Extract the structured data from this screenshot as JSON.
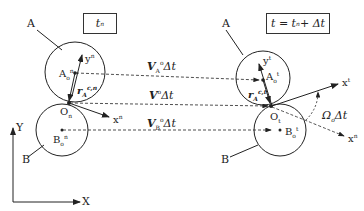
{
  "left_frame": {
    "time_box": "t",
    "time_box_sub": "n",
    "body_A_label": "A",
    "body_B_label": "B",
    "point_A": "A",
    "point_A_sub": "o",
    "point_A_sup": "n",
    "point_B": "B",
    "point_B_sub": "o",
    "point_B_sup": "n",
    "contact_point": "O",
    "contact_point_sub": "n",
    "axis_x": "x",
    "axis_x_sup": "n",
    "axis_y": "y",
    "axis_y_sup": "n",
    "r_vector": "r",
    "r_vector_sub": "A",
    "r_vector_sup": "c,n"
  },
  "right_frame": {
    "time_box": "t = t",
    "time_box_sub": "n",
    "time_box_tail": " + Δt",
    "body_A_label": "A",
    "body_B_label": "B",
    "point_A": "A",
    "point_A_sub": "o",
    "point_A_sup": "t",
    "point_B": "B",
    "point_B_sub": "o",
    "point_B_sup": "t",
    "contact_point": "O",
    "contact_point_sub": "t",
    "axis_x": "x",
    "axis_x_sup": "t",
    "axis_y": "y",
    "axis_y_sup": "t",
    "axis_x_old": "x",
    "axis_x_old_sup": "n",
    "r_vector": "r",
    "r_vector_sub": "A",
    "r_vector_sup": "c,t",
    "rotation": "Ω",
    "rotation_sub": "o",
    "rotation_tail": "Δt"
  },
  "displacements": {
    "VA": "V",
    "VA_sub": "A",
    "VA_sup": "o",
    "VA_tail": "Δt",
    "V": "V",
    "V_sup": "o",
    "V_tail": "Δt",
    "VB": "V",
    "VB_sub": "B",
    "VB_sup": "o",
    "VB_tail": "Δt"
  },
  "global_axes": {
    "X": "X",
    "Y": "Y"
  }
}
